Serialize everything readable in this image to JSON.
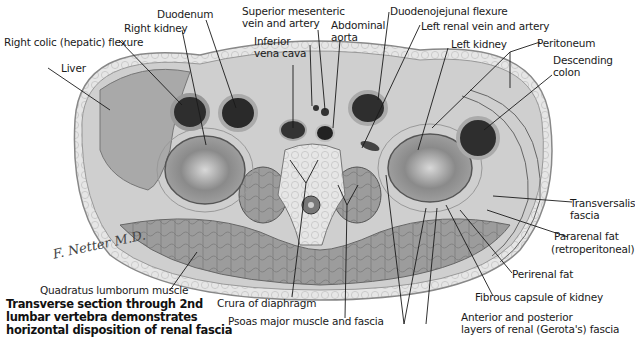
{
  "figure": {
    "caption_lines": [
      "Transverse section through 2nd",
      "lumbar vertebra demonstrates",
      "horizontal disposition of renal fascia"
    ],
    "signature": "F. Netter M.D."
  },
  "labels": {
    "duodenum": "Duodenum",
    "right_kidney": "Right kidney",
    "right_colic_flexure": "Right colic (hepatic) flexure",
    "liver": "Liver",
    "superior_mesenteric_1": "Superior mesenteric",
    "superior_mesenteric_2": "vein and artery",
    "inferior_vena_cava_1": "Inferior",
    "inferior_vena_cava_2": "vena cava",
    "abdominal_aorta_1": "Abdominal",
    "abdominal_aorta_2": "aorta",
    "duodenojejunal_flexure": "Duodenojejunal flexure",
    "left_renal_vessels": "Left renal vein and artery",
    "left_kidney": "Left kidney",
    "peritoneum": "Peritoneum",
    "descending_colon_1": "Descending",
    "descending_colon_2": "colon",
    "transversalis_fascia_1": "Transversalis",
    "transversalis_fascia_2": "fascia",
    "pararenal_fat_1": "Pararenal fat",
    "pararenal_fat_2": "(retroperitoneal)",
    "perirenal_fat": "Perirenal fat",
    "fibrous_capsule": "Fibrous capsule of kidney",
    "renal_fascia_1": "Anterior and posterior",
    "renal_fascia_2": "layers of renal (Gerota's) fascia",
    "quadratus_lumborum": "Quadratus lumborum muscle",
    "crura": "Crura of diaphragm",
    "psoas": "Psoas major muscle and fascia"
  },
  "colors": {
    "line": "#1a1a1a",
    "tissue_light": "#e4e4e4",
    "tissue_mid": "#b9b9b9",
    "tissue_dark": "#6e6e6e",
    "lumen": "#2a2a2a"
  }
}
